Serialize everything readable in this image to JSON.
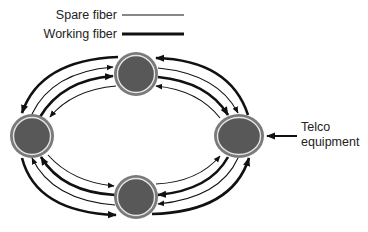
{
  "legend": {
    "items": [
      {
        "label": "Spare fiber",
        "style": "thin"
      },
      {
        "label": "Working fiber",
        "style": "thick"
      }
    ]
  },
  "nodes": [
    {
      "id": "top",
      "cx": 136,
      "cy": 74,
      "rx": 22,
      "ry": 22
    },
    {
      "id": "left",
      "cx": 32,
      "cy": 136,
      "rx": 22,
      "ry": 22
    },
    {
      "id": "right",
      "cx": 239,
      "cy": 136,
      "rx": 25,
      "ry": 22
    },
    {
      "id": "bottom",
      "cx": 136,
      "cy": 197,
      "rx": 22,
      "ry": 22
    }
  ],
  "external": {
    "line1": "Telco",
    "line2": "equipment",
    "arrow_direction": "left"
  },
  "colors": {
    "node_fill": "#585858",
    "node_ring": "#7a7a7a",
    "node_inner_ring": "#e6e6e6",
    "line": "#111111",
    "text": "#222222"
  }
}
